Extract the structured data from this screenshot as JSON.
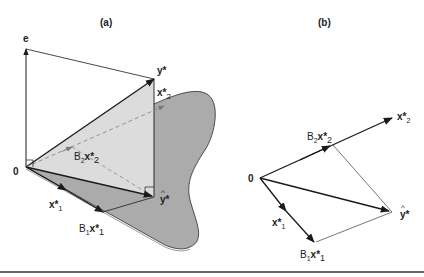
{
  "panels": {
    "a": {
      "title": "(a)",
      "labels": {
        "e": "e",
        "y_star": "y*",
        "x2_star_base": "x*",
        "x2_star_sub": "2",
        "B2x2_B": "B",
        "B2x2_Bsub": "2",
        "B2x2_x": "x*",
        "B2x2_sub": "2",
        "origin": "0",
        "x1_star_base": "x*",
        "x1_star_sub": "1",
        "B1x1_B": "B",
        "B1x1_Bsub": "1",
        "B1x1_x": "x*",
        "B1x1_sub": "1",
        "y_hat_star": "y*",
        "hat": "^"
      }
    },
    "b": {
      "title": "(b)",
      "labels": {
        "origin": "0",
        "x2_star_base": "x*",
        "x2_star_sub": "2",
        "B2x2_B": "B",
        "B2x2_Bsub": "2",
        "B2x2_x": "x*",
        "B2x2_sub": "2",
        "x1_star_base": "x*",
        "x1_star_sub": "1",
        "B1x1_B": "B",
        "B1x1_Bsub": "1",
        "B1x1_x": "x*",
        "B1x1_sub": "1",
        "y_hat_star": "y*",
        "hat": "^"
      }
    }
  },
  "colors": {
    "plane_fill": "#a9a9a9",
    "triangle_fill": "#d9d9d9",
    "stroke": "#1a1a1a",
    "dashed": "#8a8a8a",
    "rule": "#6a6a6a"
  }
}
